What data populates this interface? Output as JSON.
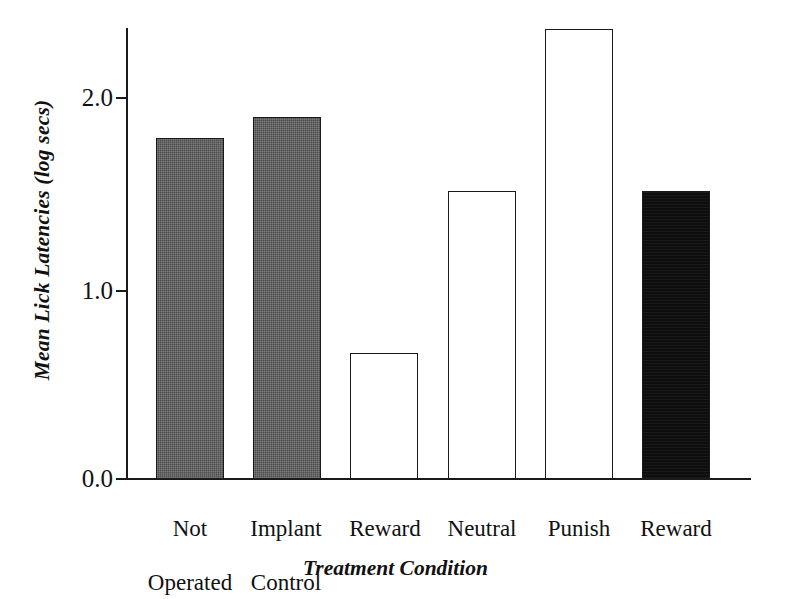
{
  "chart_data": {
    "type": "bar",
    "title": "",
    "subtitle": "",
    "xlabel": "Treatment Condition",
    "ylabel": "Mean Lick Latencies (log secs)",
    "categories": [
      "Not Operated",
      "Implant Control",
      "Reward",
      "Neutral",
      "Punish",
      "Reward"
    ],
    "category_lines": [
      [
        "Not",
        "Operated"
      ],
      [
        "Implant",
        "Control"
      ],
      [
        "Reward"
      ],
      [
        "Neutral"
      ],
      [
        "Punish"
      ],
      [
        "Reward"
      ]
    ],
    "values": [
      1.79,
      1.9,
      0.66,
      1.51,
      2.36,
      1.51
    ],
    "bar_fills": [
      "gray",
      "gray",
      "white",
      "white",
      "white",
      "black"
    ],
    "bar_colors": [
      "#4e4e4e",
      "#4e4e4e",
      "#ffffff",
      "#ffffff",
      "#ffffff",
      "#0d0d0d"
    ],
    "bar_edge_color": "#1a1a1a",
    "ylim": [
      0.0,
      2.45
    ],
    "yticks": [
      0.0,
      1.0,
      2.0
    ],
    "ytick_labels": [
      "0.0",
      "1.0",
      "2.0"
    ],
    "xlim": [
      0,
      6
    ],
    "grid": false,
    "legend": null,
    "axis_color": "#1a1a1a",
    "background": "#ffffff"
  },
  "axis": {
    "y_title": "Mean Lick Latencies (log secs)",
    "x_title": "Treatment Condition",
    "ytick_0": "0.0",
    "ytick_1": "1.0",
    "ytick_2": "2.0"
  },
  "categories": {
    "c0_line1": "Not",
    "c0_line2": "Operated",
    "c1_line1": "Implant",
    "c1_line2": "Control",
    "c2_line1": "Reward",
    "c3_line1": "Neutral",
    "c4_line1": "Punish",
    "c5_line1": "Reward"
  }
}
